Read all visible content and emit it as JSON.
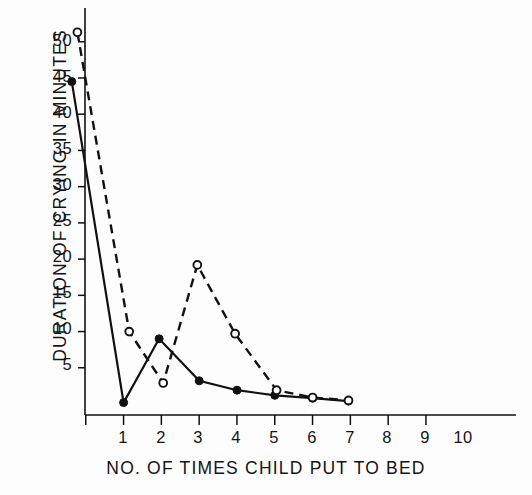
{
  "chart_data": {
    "type": "line",
    "title": "",
    "xlabel": "NO. OF TIMES CHILD PUT TO BED",
    "ylabel": "DURATION OF CRYING IN MINUTES",
    "xlim": [
      0.3,
      10.6
    ],
    "ylim": [
      0,
      53
    ],
    "grid": false,
    "legend": "none",
    "xticks": [
      "1",
      "2",
      "3",
      "4",
      "5",
      "6",
      "7",
      "8",
      "9",
      "10"
    ],
    "xtick_values": [
      1,
      2,
      3,
      4,
      5,
      6,
      7,
      8,
      9,
      10
    ],
    "yticks": [
      "5",
      "10",
      "15",
      "20",
      "25",
      "30",
      "35",
      "40",
      "45",
      "50"
    ],
    "ytick_values": [
      5,
      10,
      15,
      20,
      25,
      30,
      35,
      40,
      45,
      50
    ],
    "series": [
      {
        "name": "solid-filled-circles",
        "style": "solid",
        "marker": "filled-circle",
        "color": "#111111",
        "x": [
          0.63,
          2.0,
          2.94,
          4.0,
          5.0,
          6.0,
          7.0,
          7.95
        ],
        "values": [
          44.5,
          0.2,
          9.0,
          3.2,
          1.9,
          1.2,
          0.8,
          0.4
        ]
      },
      {
        "name": "dashed-open-circles",
        "style": "dashed",
        "marker": "open-circle",
        "color": "#111111",
        "x": [
          0.78,
          2.15,
          3.05,
          3.95,
          4.95,
          6.05,
          7.0,
          7.95
        ],
        "values": [
          51.3,
          10.0,
          2.9,
          19.2,
          9.7,
          1.9,
          0.9,
          0.5
        ]
      }
    ]
  }
}
